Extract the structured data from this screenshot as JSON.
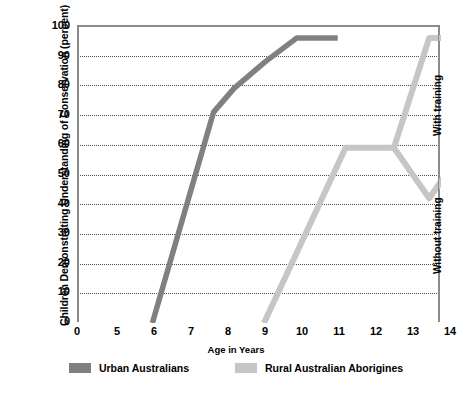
{
  "chart": {
    "type": "line",
    "title": "",
    "xlabel": "Age in Years",
    "ylabel": "Children Demonstrating Understanding of Conservation (percent)",
    "xlim": [
      0,
      14
    ],
    "ylim": [
      0,
      100
    ],
    "x_ticks": [
      "0",
      "5",
      "6",
      "7",
      "8",
      "9",
      "10",
      "11",
      "12",
      "13",
      "14"
    ],
    "y_ticks": [
      "0",
      "10",
      "20",
      "30",
      "40",
      "50",
      "60",
      "70",
      "80",
      "90",
      "100"
    ],
    "grid": "horizontal-dotted",
    "legend_position": "bottom-center",
    "annotations": [
      {
        "text": "With training",
        "orientation": "vertical",
        "location": "right-edge-upper"
      },
      {
        "text": "Without training",
        "orientation": "vertical",
        "location": "right-edge-lower"
      }
    ],
    "series": [
      {
        "name": "Urban Australians",
        "color": "#808080",
        "points": [
          {
            "x": 5.0,
            "y": 0
          },
          {
            "x": 6.65,
            "y": 71
          },
          {
            "x": 7.2,
            "y": 79
          },
          {
            "x": 8.05,
            "y": 88
          },
          {
            "x": 8.9,
            "y": 96
          },
          {
            "x": 10.0,
            "y": 96
          }
        ]
      },
      {
        "name": "Rural Australian Aborigines",
        "color": "#c6c6c6",
        "points": [
          {
            "x": 8.0,
            "y": 0
          },
          {
            "x": 10.2,
            "y": 59
          },
          {
            "x": 11.5,
            "y": 59
          },
          {
            "x": 12.45,
            "y": 96
          },
          {
            "x": 14.0,
            "y": 96
          }
        ],
        "branch": {
          "name": "Without training branch",
          "points": [
            {
              "x": 11.5,
              "y": 59
            },
            {
              "x": 12.45,
              "y": 42
            },
            {
              "x": 13.4,
              "y": 59
            },
            {
              "x": 14.0,
              "y": 59
            }
          ]
        }
      }
    ]
  },
  "legend": {
    "items": [
      {
        "label": "Urban Australians",
        "color": "#808080"
      },
      {
        "label": "Rural Australian Aborigines",
        "color": "#c6c6c6"
      }
    ]
  },
  "axes": {
    "y_title": "Children Demonstrating Understanding of Conservation (percent)",
    "x_title": "Age in Years"
  },
  "notes": {
    "with_training": "With training",
    "without_training": "Without training"
  },
  "colors": {
    "dark_line": "#808080",
    "light_line": "#c6c6c6",
    "grid": "#4d4d4d",
    "frame": "#8b8b8b"
  }
}
